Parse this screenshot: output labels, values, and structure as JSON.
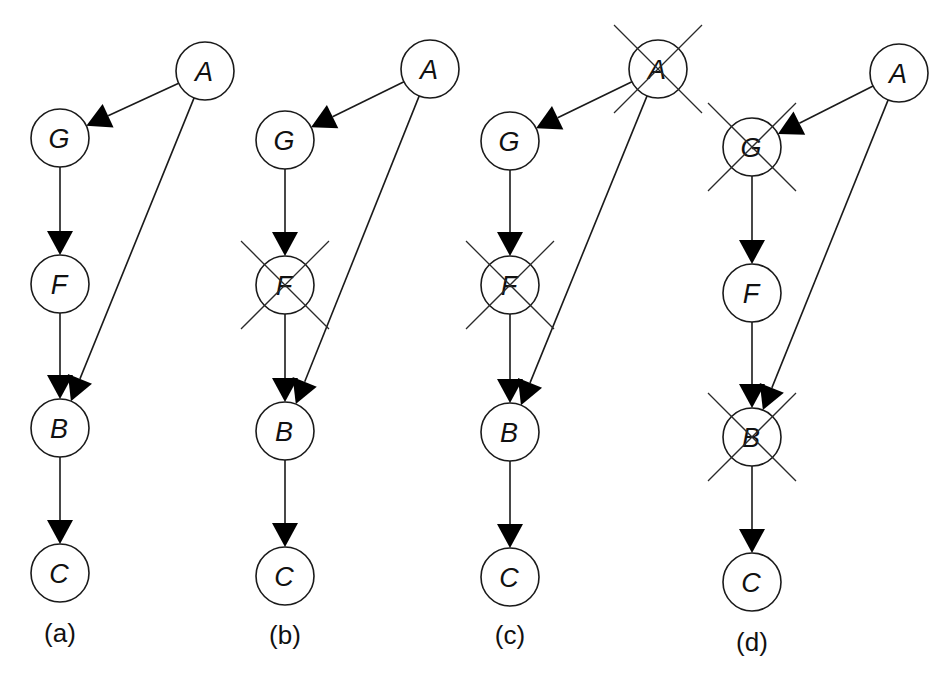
{
  "figure": {
    "node_radius": 29,
    "colors": {
      "stroke": "#1a1a1a",
      "fill": "#ffffff",
      "arrowhead": "#000000",
      "cross": "#2a2a2a"
    },
    "panels": [
      {
        "id": "a",
        "label": "(a)",
        "label_pos": [
          60,
          642
        ],
        "nodes": [
          {
            "id": "A",
            "label": "A",
            "x": 205,
            "y": 71,
            "crossed": false
          },
          {
            "id": "G",
            "label": "G",
            "x": 60,
            "y": 138,
            "crossed": false
          },
          {
            "id": "F",
            "label": "F",
            "x": 60,
            "y": 284,
            "crossed": false
          },
          {
            "id": "B",
            "label": "B",
            "x": 60,
            "y": 428,
            "crossed": false
          },
          {
            "id": "C",
            "label": "C",
            "x": 60,
            "y": 573,
            "crossed": false
          }
        ],
        "edges": [
          [
            "A",
            "G"
          ],
          [
            "G",
            "F"
          ],
          [
            "F",
            "B"
          ],
          [
            "A",
            "B"
          ],
          [
            "B",
            "C"
          ]
        ]
      },
      {
        "id": "b",
        "label": "(b)",
        "label_pos": [
          285,
          644
        ],
        "nodes": [
          {
            "id": "A",
            "label": "A",
            "x": 430,
            "y": 69,
            "crossed": false
          },
          {
            "id": "G",
            "label": "G",
            "x": 285,
            "y": 140,
            "crossed": false
          },
          {
            "id": "F",
            "label": "F",
            "x": 285,
            "y": 285,
            "crossed": true
          },
          {
            "id": "B",
            "label": "B",
            "x": 285,
            "y": 431,
            "crossed": false
          },
          {
            "id": "C",
            "label": "C",
            "x": 285,
            "y": 576,
            "crossed": false
          }
        ],
        "edges": [
          [
            "A",
            "G"
          ],
          [
            "G",
            "F"
          ],
          [
            "F",
            "B"
          ],
          [
            "A",
            "B"
          ],
          [
            "B",
            "C"
          ]
        ]
      },
      {
        "id": "c",
        "label": "(c)",
        "label_pos": [
          510,
          644
        ],
        "nodes": [
          {
            "id": "A",
            "label": "A",
            "x": 658,
            "y": 69,
            "crossed": true
          },
          {
            "id": "G",
            "label": "G",
            "x": 510,
            "y": 141,
            "crossed": false
          },
          {
            "id": "F",
            "label": "F",
            "x": 510,
            "y": 285,
            "crossed": true
          },
          {
            "id": "B",
            "label": "B",
            "x": 510,
            "y": 432,
            "crossed": false
          },
          {
            "id": "C",
            "label": "C",
            "x": 510,
            "y": 577,
            "crossed": false
          }
        ],
        "edges": [
          [
            "A",
            "G"
          ],
          [
            "G",
            "F"
          ],
          [
            "F",
            "B"
          ],
          [
            "A",
            "B"
          ],
          [
            "B",
            "C"
          ]
        ]
      },
      {
        "id": "d",
        "label": "(d)",
        "label_pos": [
          752,
          651
        ],
        "nodes": [
          {
            "id": "A",
            "label": "A",
            "x": 899,
            "y": 73,
            "crossed": false
          },
          {
            "id": "G",
            "label": "G",
            "x": 752,
            "y": 147,
            "crossed": true
          },
          {
            "id": "F",
            "label": "F",
            "x": 752,
            "y": 293,
            "crossed": false
          },
          {
            "id": "B",
            "label": "B",
            "x": 752,
            "y": 437,
            "crossed": true
          },
          {
            "id": "C",
            "label": "C",
            "x": 752,
            "y": 582,
            "crossed": false
          }
        ],
        "edges": [
          [
            "A",
            "G"
          ],
          [
            "G",
            "F"
          ],
          [
            "F",
            "B"
          ],
          [
            "A",
            "B"
          ],
          [
            "B",
            "C"
          ]
        ]
      }
    ]
  }
}
